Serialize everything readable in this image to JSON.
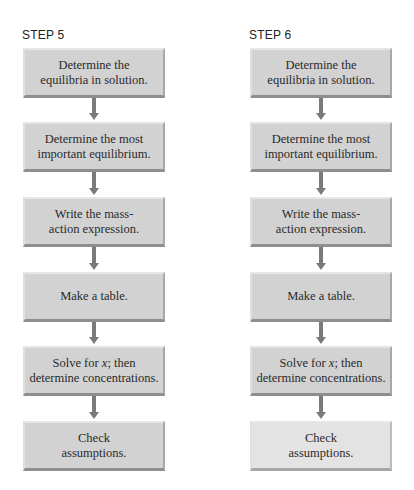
{
  "columns": [
    {
      "label": "STEP 5",
      "highlighted_index": null,
      "steps": [
        {
          "line1": "Determine the",
          "line2": "equilibria in solution."
        },
        {
          "line1": "Determine the most",
          "line2": "important equilibrium."
        },
        {
          "line1": "Write the mass-",
          "line2": "action expression."
        },
        {
          "line1": "Make a table.",
          "line2": ""
        },
        {
          "line1": "Solve for x; then",
          "line2": "determine concentrations."
        },
        {
          "line1": "Check",
          "line2": "assumptions."
        }
      ]
    },
    {
      "label": "STEP 6",
      "highlighted_index": 5,
      "steps": [
        {
          "line1": "Determine the",
          "line2": "equilibria in solution."
        },
        {
          "line1": "Determine the most",
          "line2": "important equilibrium."
        },
        {
          "line1": "Write the mass-",
          "line2": "action expression."
        },
        {
          "line1": "Make a table.",
          "line2": ""
        },
        {
          "line1": "Solve for x; then",
          "line2": "determine concentrations."
        },
        {
          "line1": "Check",
          "line2": "assumptions."
        }
      ]
    }
  ],
  "colors": {
    "box_fill": "#d2d2d2",
    "box_highlight_fill": "#e3e3e3",
    "arrow": "#7a7a7a",
    "text": "#2a2a2a"
  }
}
